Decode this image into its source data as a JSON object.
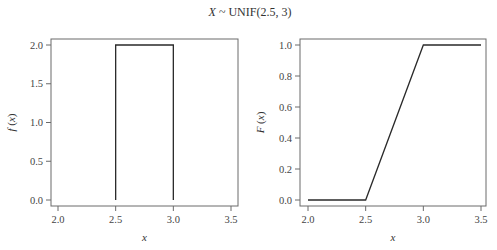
{
  "title": "X ~ UNIF(2.5, 3)",
  "title_parts": {
    "var": "X",
    "rest": " ~ UNIF(2.5, 3)"
  },
  "chart_data": [
    {
      "type": "line",
      "name": "pdf",
      "title": "",
      "xlabel": "x",
      "ylabel": "f (x)",
      "ylabel_parts": {
        "fn": "f",
        "arg": "x"
      },
      "xlim": [
        1.97,
        3.58
      ],
      "ylim": [
        -0.07,
        2.07
      ],
      "grid": false,
      "xticks": [
        2.0,
        2.5,
        3.0,
        3.5
      ],
      "xtick_labels": [
        "2.0",
        "2.5",
        "3.0",
        "3.5"
      ],
      "yticks": [
        0.0,
        0.5,
        1.0,
        1.5,
        2.0
      ],
      "ytick_labels": [
        "0.0",
        "0.5",
        "1.0",
        "1.5",
        "2.0"
      ],
      "series": [
        {
          "name": "f(x)",
          "x": [
            2.5,
            2.5,
            3.0,
            3.0
          ],
          "y": [
            0.0,
            2.0,
            2.0,
            0.0
          ]
        }
      ]
    },
    {
      "type": "line",
      "name": "cdf",
      "title": "",
      "xlabel": "x",
      "ylabel": "F (x)",
      "ylabel_parts": {
        "fn": "F",
        "arg": "x"
      },
      "xlim": [
        1.97,
        3.58
      ],
      "ylim": [
        -0.035,
        1.035
      ],
      "grid": false,
      "xticks": [
        2.0,
        2.5,
        3.0,
        3.5
      ],
      "xtick_labels": [
        "2.0",
        "2.5",
        "3.0",
        "3.5"
      ],
      "yticks": [
        0.0,
        0.2,
        0.4,
        0.6,
        0.8,
        1.0
      ],
      "ytick_labels": [
        "0.0",
        "0.2",
        "0.4",
        "0.6",
        "0.8",
        "1.0"
      ],
      "series": [
        {
          "name": "F(x)",
          "x": [
            2.0,
            2.5,
            3.0,
            3.5
          ],
          "y": [
            0.0,
            0.0,
            1.0,
            1.0
          ]
        }
      ]
    }
  ],
  "colors": {
    "curve": "#2a2a2a",
    "frame": "#6a6a6a",
    "text": "#333333"
  }
}
